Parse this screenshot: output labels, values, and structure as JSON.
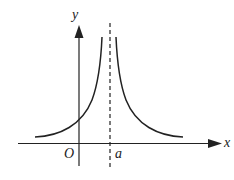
{
  "diagram": {
    "axes": {
      "x_label": "x",
      "y_label": "y",
      "origin_label": "O"
    },
    "asymptote": {
      "label": "a",
      "style": "dashed"
    },
    "colors": {
      "line": "#222222",
      "background": "#ffffff"
    }
  }
}
